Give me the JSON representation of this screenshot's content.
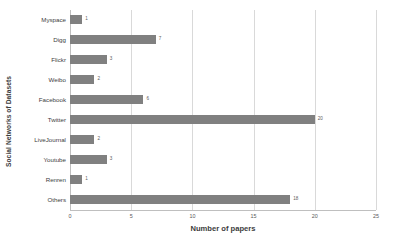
{
  "chart_data": {
    "type": "bar",
    "orientation": "horizontal",
    "title": "",
    "xlabel": "Number of papers",
    "ylabel": "Social Networks of Datasets",
    "categories": [
      "Myspace",
      "Digg",
      "Flickr",
      "Weibo",
      "Facebook",
      "Twitter",
      "LiveJournal",
      "Youtube",
      "Renren",
      "Others"
    ],
    "values": [
      1,
      7,
      3,
      2,
      6,
      20,
      2,
      3,
      1,
      18
    ],
    "value_labels": [
      "1",
      "7",
      "3",
      "2",
      "6",
      "20",
      "2",
      "3",
      "1",
      "18"
    ],
    "xlim": [
      0,
      25
    ],
    "xticks": [
      0,
      5,
      10,
      15,
      20,
      25
    ],
    "xtick_labels": [
      "0",
      "5",
      "10",
      "15",
      "20",
      "25"
    ],
    "grid": "vertical",
    "legend": "none",
    "bar_color": "#808080",
    "grid_color": "#d9d9d9",
    "axis_color": "#bfbfbf",
    "background": "#ffffff"
  }
}
